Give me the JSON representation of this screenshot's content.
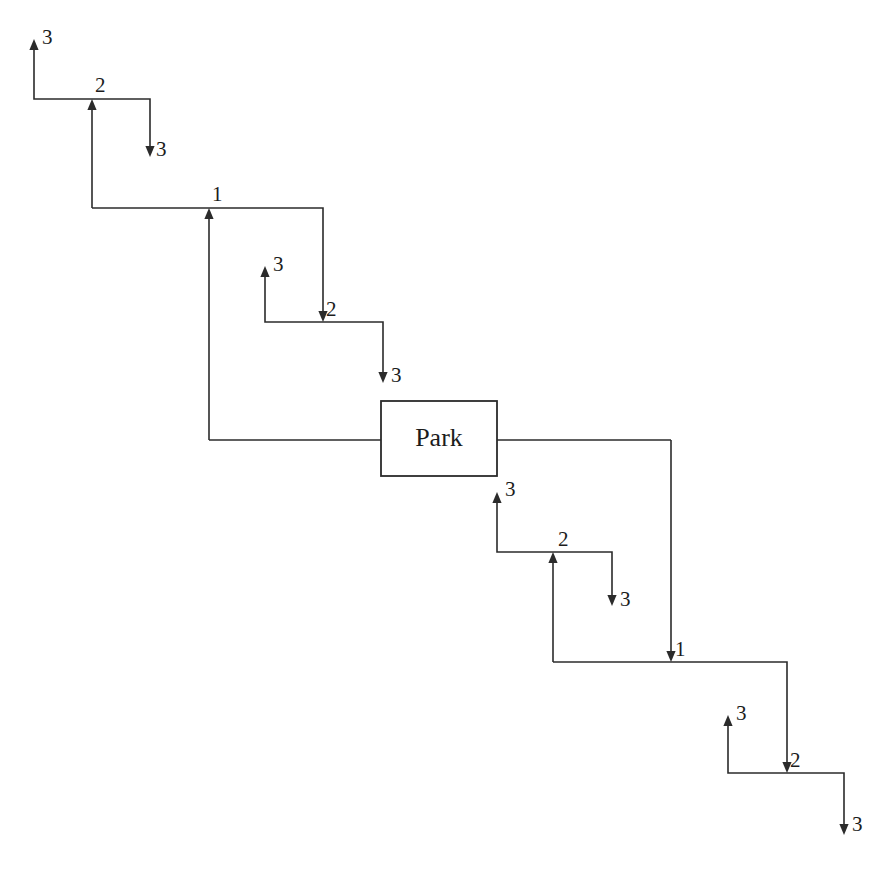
{
  "diagram": {
    "title": "Park",
    "type": "stair-step-flow-diagram",
    "background_color": "#ffffff",
    "stroke_color": "#2b2b2b",
    "text_color": "#1c1c1c",
    "canvas": {
      "width": 887,
      "height": 869
    },
    "nodes": [
      {
        "id": "park-box",
        "label": "Park",
        "shape": "rectangle",
        "x": 381,
        "y": 401,
        "width": 116,
        "height": 75,
        "label_x": 439,
        "label_y": 440
      }
    ],
    "junction_labels": [
      {
        "id": "junction-2-top-left",
        "label": "2",
        "x": 95,
        "y": 92
      },
      {
        "id": "junction-1-upper",
        "label": "1",
        "x": 212,
        "y": 201
      },
      {
        "id": "junction-2-upper-middle",
        "label": "2",
        "x": 326,
        "y": 316
      },
      {
        "id": "junction-2-lower-middle",
        "label": "2",
        "x": 558,
        "y": 546
      },
      {
        "id": "junction-1-lower",
        "label": "1",
        "x": 675,
        "y": 656
      },
      {
        "id": "junction-2-bottom-right",
        "label": "2",
        "x": 790,
        "y": 767
      }
    ],
    "terminal_labels": [
      {
        "id": "terminal-3-top-left",
        "label": "3",
        "x": 42,
        "y": 44,
        "direction": "up"
      },
      {
        "id": "terminal-3-upper-right",
        "label": "3",
        "x": 156,
        "y": 156,
        "direction": "down"
      },
      {
        "id": "terminal-3-mid-up",
        "label": "3",
        "x": 273,
        "y": 271,
        "direction": "up"
      },
      {
        "id": "terminal-3-mid-down",
        "label": "3",
        "x": 391,
        "y": 382,
        "direction": "down"
      },
      {
        "id": "terminal-3-park-up",
        "label": "3",
        "x": 505,
        "y": 496,
        "direction": "up"
      },
      {
        "id": "terminal-3-lower-down",
        "label": "3",
        "x": 620,
        "y": 606,
        "direction": "down"
      },
      {
        "id": "terminal-3-bottom-up",
        "label": "3",
        "x": 736,
        "y": 720,
        "direction": "up"
      },
      {
        "id": "terminal-3-bottom-down",
        "label": "3",
        "x": 852,
        "y": 831,
        "direction": "down"
      }
    ],
    "edges": [
      {
        "id": "edge-3-to-2-top-left",
        "path": "M 34 47 L 34 99 L 92 99",
        "arrow": "up",
        "arrow_x": 34,
        "arrow_y": 39
      },
      {
        "id": "edge-2-to-3-top-right",
        "path": "M 92 99 L 150 99 L 150 149",
        "arrow": "down",
        "arrow_x": 150,
        "arrow_y": 157
      },
      {
        "id": "edge-1-to-2-riser",
        "path": "M 92 208 L 92 107",
        "arrow": "up",
        "arrow_x": 92,
        "arrow_y": 99
      },
      {
        "id": "edge-upper-horizontal",
        "path": "M 92 208 L 209 208",
        "arrow": "none"
      },
      {
        "id": "edge-1-to-2-upper-middle",
        "path": "M 209 208 L 323 208 L 323 314",
        "arrow": "down",
        "arrow_x": 323,
        "arrow_y": 322
      },
      {
        "id": "edge-3-to-2-upper-middle",
        "path": "M 265 274 L 265 322 L 323 322",
        "arrow": "up",
        "arrow_x": 265,
        "arrow_y": 266
      },
      {
        "id": "edge-2-to-3-upper-middle",
        "path": "M 323 322 L 383 322 L 383 375",
        "arrow": "down",
        "arrow_x": 383,
        "arrow_y": 383
      },
      {
        "id": "edge-park-to-1-riser",
        "path": "M 209 440 L 209 216",
        "arrow": "up",
        "arrow_x": 209,
        "arrow_y": 208
      },
      {
        "id": "edge-park-left-horizontal",
        "path": "M 209 440 L 381 440",
        "arrow": "none"
      },
      {
        "id": "edge-park-right-horizontal",
        "path": "M 497 440 L 671 440",
        "arrow": "none"
      },
      {
        "id": "edge-3-to-2-lower-middle",
        "path": "M 497 500 L 497 552 L 555 552",
        "arrow": "up",
        "arrow_x": 497,
        "arrow_y": 492
      },
      {
        "id": "edge-2-to-3-lower-middle",
        "path": "M 555 552 L 612 552 L 612 598",
        "arrow": "down",
        "arrow_x": 612,
        "arrow_y": 606
      },
      {
        "id": "edge-1-to-2-lower-riser",
        "path": "M 553 662 L 553 560",
        "arrow": "up",
        "arrow_x": 553,
        "arrow_y": 552
      },
      {
        "id": "edge-lower-horizontal",
        "path": "M 553 662 L 671 662",
        "arrow": "none"
      },
      {
        "id": "edge-park-to-1-lower",
        "path": "M 671 440 L 671 654",
        "arrow": "down",
        "arrow_x": 671,
        "arrow_y": 662
      },
      {
        "id": "edge-1-to-2-bottom-right",
        "path": "M 671 662 L 787 662 L 787 765",
        "arrow": "down",
        "arrow_x": 787,
        "arrow_y": 773
      },
      {
        "id": "edge-3-to-2-bottom-right",
        "path": "M 728 723 L 728 773 L 787 773",
        "arrow": "up",
        "arrow_x": 728,
        "arrow_y": 715
      },
      {
        "id": "edge-2-to-3-bottom-right",
        "path": "M 787 773 L 844 773 L 844 827",
        "arrow": "down",
        "arrow_x": 844,
        "arrow_y": 835
      }
    ]
  }
}
